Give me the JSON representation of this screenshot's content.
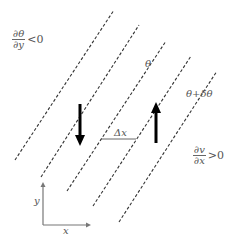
{
  "diagram": {
    "type": "vorticity/gradient schematic",
    "labels": {
      "top_left_fraction": {
        "numerator": "∂θ",
        "denominator": "∂y",
        "relation": "<0"
      },
      "right_fraction": {
        "numerator": "∂v",
        "denominator": "∂x",
        "relation": ">0"
      },
      "theta": "θ",
      "theta_plus": "θ+δθ",
      "delta_x": "Δx",
      "axis_x": "x",
      "axis_y": "y"
    },
    "colors": {
      "dashed_line": "#333333",
      "arrow": "#000000",
      "axis": "#777777",
      "text": "#555555"
    },
    "dashed_lines": [
      {
        "x1": 15,
        "y1": 160,
        "x2": 114,
        "y2": 10
      },
      {
        "x1": 41,
        "y1": 177,
        "x2": 139,
        "y2": 25
      },
      {
        "x1": 67,
        "y1": 191,
        "x2": 166,
        "y2": 41
      },
      {
        "x1": 93,
        "y1": 206,
        "x2": 191,
        "y2": 56
      },
      {
        "x1": 119,
        "y1": 222,
        "x2": 217,
        "y2": 71
      }
    ],
    "arrows": [
      {
        "direction": "down",
        "x": 80,
        "y_start": 104,
        "y_end": 146
      },
      {
        "direction": "up",
        "x": 156,
        "y_start": 143,
        "y_end": 102
      }
    ]
  }
}
